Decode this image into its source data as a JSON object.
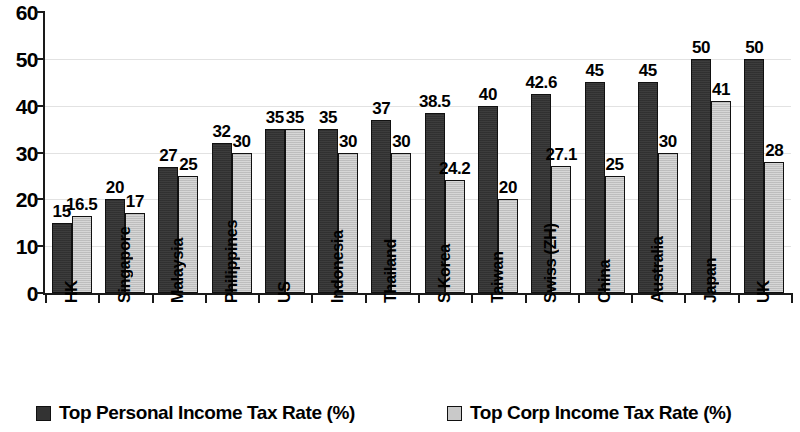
{
  "chart_data": {
    "type": "bar",
    "title": "",
    "subtitle": "",
    "xlabel": "",
    "ylabel": "",
    "ylim": [
      0,
      60
    ],
    "yticks": [
      0,
      10,
      20,
      30,
      40,
      50,
      60
    ],
    "grid": true,
    "legend_position": "bottom",
    "categories": [
      "HK",
      "Singapore",
      "Malaysia",
      "Philippines",
      "US",
      "Indonesia",
      "Thailand",
      "S Korea",
      "Taiwan",
      "Swiss (ZH)",
      "China",
      "Australia",
      "Japan",
      "UK"
    ],
    "series": [
      {
        "name": "Top Personal Income Tax Rate (%)",
        "color": "#333333",
        "values": [
          15,
          20,
          27,
          32,
          35,
          35,
          37,
          38.5,
          40,
          42.6,
          45,
          45,
          50,
          50
        ],
        "labels": [
          "15",
          "20",
          "27",
          "32",
          "35",
          "35",
          "37",
          "38.5",
          "40",
          "42.6",
          "45",
          "45",
          "50",
          "50"
        ]
      },
      {
        "name": "Top Corp Income Tax Rate (%)",
        "color": "#c9c9c9",
        "values": [
          16.5,
          17,
          25,
          30,
          35,
          30,
          30,
          24.2,
          20,
          27.1,
          25,
          30,
          41,
          28
        ],
        "labels": [
          "16.5",
          "17",
          "25",
          "30",
          "35",
          "30",
          "30",
          "24.2",
          "20",
          "27.1",
          "25",
          "30",
          "41",
          "28"
        ]
      }
    ]
  },
  "legend": {
    "items": [
      {
        "label": "Top Personal Income Tax Rate (%)",
        "swatch": "dark-square-icon"
      },
      {
        "label": "Top Corp Income Tax Rate (%)",
        "swatch": "light-square-icon"
      }
    ]
  }
}
